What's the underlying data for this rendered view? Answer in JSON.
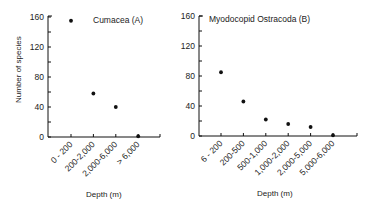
{
  "chart_data": [
    {
      "type": "scatter",
      "title": "Cumacea (A)",
      "xlabel": "Depth (m)",
      "ylabel": "Number of species",
      "categories": [
        "0-200",
        "200-2,000",
        "2,000-6,000",
        "> 6,000"
      ],
      "values": [
        155,
        58,
        40,
        1
      ],
      "ylim": [
        0,
        160
      ],
      "yticks": [
        0,
        40,
        80,
        120,
        160
      ],
      "grid": false,
      "legend": "none"
    },
    {
      "type": "scatter",
      "title": "Myodocopid Ostracoda (B)",
      "xlabel": "Depth (m)",
      "ylabel": "",
      "categories": [
        "6-200",
        "200-500",
        "500-1,000",
        "1,000-2,000",
        "2,000-5,000",
        "5,000-6,000"
      ],
      "values": [
        85,
        46,
        22,
        16,
        12,
        1
      ],
      "ylim": [
        0,
        160
      ],
      "yticks": [
        0,
        40,
        80,
        120,
        160
      ],
      "grid": false,
      "legend": "none"
    }
  ],
  "charts": {
    "left": {
      "title": "Cumacea (A)",
      "ylabel": "Number of species",
      "xlabel": "Depth (m)",
      "yticks": [
        "0",
        "40",
        "80",
        "120",
        "160"
      ],
      "xticks": [
        "0 - 200",
        "200-2,000",
        "2,000-6,000",
        "> 6,000"
      ]
    },
    "right": {
      "title": "Myodocopid  Ostracoda (B)",
      "xlabel": "Depth (m)",
      "yticks": [
        "0",
        "40",
        "80",
        "120",
        "160"
      ],
      "xticks": [
        "6 - 200",
        "200-500",
        "500-1,000",
        "1,000-2,000",
        "2,000-5,000",
        "5,000-6,000"
      ]
    }
  }
}
